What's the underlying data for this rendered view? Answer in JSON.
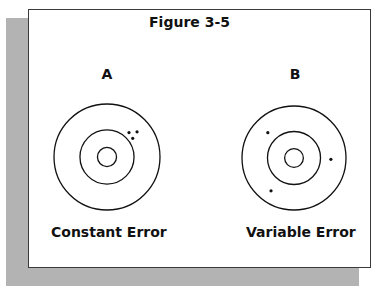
{
  "figure": {
    "title": "Figure 3-5",
    "colors": {
      "ink": "#111111",
      "shadow": "#b3b3b3",
      "background": "#ffffff"
    },
    "panels": [
      {
        "label": "A",
        "caption": "Constant Error",
        "rings": 3,
        "shots": [
          {
            "angle_deg": 48,
            "radius_frac": 0.62
          },
          {
            "angle_deg": 40,
            "radius_frac": 0.74
          },
          {
            "angle_deg": 36,
            "radius_frac": 0.6
          }
        ]
      },
      {
        "label": "B",
        "caption": "Variable Error",
        "rings": 3,
        "shots": [
          {
            "angle_deg": 136,
            "radius_frac": 0.7
          },
          {
            "angle_deg": -2,
            "radius_frac": 0.71
          },
          {
            "angle_deg": 235,
            "radius_frac": 0.77
          }
        ]
      }
    ]
  }
}
